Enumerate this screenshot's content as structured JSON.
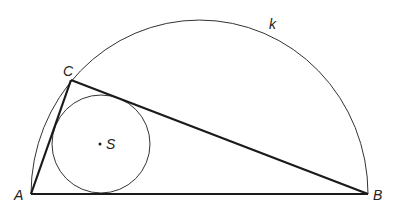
{
  "diagram": {
    "colors": {
      "stroke": "#222222",
      "background": "#ffffff"
    },
    "points": {
      "A": {
        "label": "A",
        "x": 31,
        "y": 194
      },
      "B": {
        "label": "B",
        "x": 368,
        "y": 194
      },
      "C": {
        "label": "C",
        "x": 71,
        "y": 80
      },
      "S": {
        "label": "S",
        "x": 100,
        "y": 144
      }
    },
    "semicircle": {
      "label": "k",
      "cx": 199.5,
      "cy": 194,
      "rx": 168.5,
      "ry": 174
    },
    "incircle": {
      "cx": 101,
      "cy": 144,
      "r": 49
    },
    "labels": {
      "A": "A",
      "B": "B",
      "C": "C",
      "S": "S",
      "k": "k"
    }
  }
}
